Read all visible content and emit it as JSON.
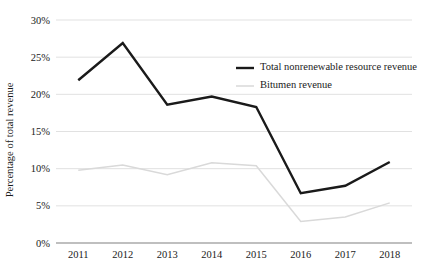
{
  "chart_data": {
    "type": "line",
    "title": "",
    "xlabel": "",
    "ylabel": "Percentage of total revenue",
    "x": [
      "2011",
      "2012",
      "2013",
      "2014",
      "2015",
      "2016",
      "2017",
      "2018"
    ],
    "categories": [
      "2011",
      "2012",
      "2013",
      "2014",
      "2015",
      "2016",
      "2017",
      "2018"
    ],
    "ylim": [
      0,
      30
    ],
    "ytick_values": [
      0,
      5,
      10,
      15,
      20,
      25,
      30
    ],
    "ytick_labels": [
      "0%",
      "5%",
      "10%",
      "15%",
      "20%",
      "25%",
      "30%"
    ],
    "grid": true,
    "legend_position": "upper-right-inside",
    "series": [
      {
        "name": "Total nonrenewable resource revenue",
        "color": "#1a1a1a",
        "width": 2.4,
        "values": [
          21.9,
          26.9,
          18.6,
          19.7,
          18.3,
          6.7,
          7.7,
          10.9
        ]
      },
      {
        "name": "Bitumen revenue",
        "color": "#d9d9d9",
        "width": 1.5,
        "values": [
          9.8,
          10.5,
          9.2,
          10.8,
          10.4,
          2.9,
          3.5,
          5.4
        ]
      }
    ]
  },
  "colors": {
    "gridline": "#d9d9d9",
    "axis": "#808080",
    "text": "#1a1a1a",
    "background": "#ffffff"
  }
}
